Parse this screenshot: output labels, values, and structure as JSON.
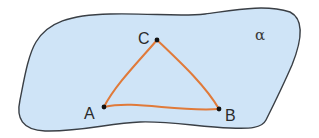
{
  "figure": {
    "plane": {
      "label": "α",
      "fill_color": "#cfe4f7",
      "stroke_color": "#3a3f45"
    },
    "triangle": {
      "edge_color": "#e07a3a",
      "vertex_color": "#111111",
      "vertices": [
        {
          "name": "C",
          "x": 157,
          "y": 40
        },
        {
          "name": "A",
          "x": 104,
          "y": 107
        },
        {
          "name": "B",
          "x": 219,
          "y": 109
        }
      ]
    }
  }
}
